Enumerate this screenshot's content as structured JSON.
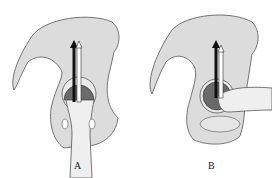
{
  "figure": {
    "panels": [
      {
        "id": "A",
        "label": "A",
        "description": "Hip bone with femoral head in acetabulum, femur vertical; dark and light arrows pointing upward through the joint"
      },
      {
        "id": "B",
        "label": "B",
        "description": "Hip bone with femoral head in acetabulum, femur horizontal (abducted); dark and light arrows pointing upward"
      }
    ],
    "colors": {
      "bone_fill": "#dcdcdc",
      "bone_outline": "#555555",
      "femoral_head": "#6a6a6a",
      "dark_arrow": "#111111",
      "light_arrow": "#ffffff",
      "femur_fill": "#efefef"
    }
  }
}
